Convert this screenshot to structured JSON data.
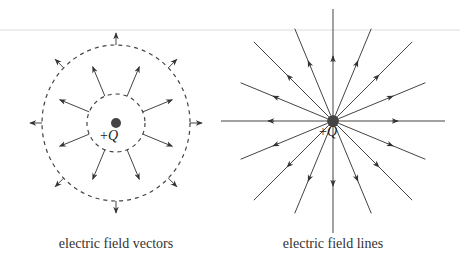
{
  "figure": {
    "left": {
      "caption": "electric field vectors",
      "charge_label_sign": "+",
      "charge_label_symbol": "Q",
      "center": [
        116,
        123
      ],
      "inner_circle_radius": 29,
      "outer_ellipse_radii": [
        74,
        78
      ],
      "inner_vector_count": 8,
      "outer_vector_count": 8
    },
    "right": {
      "caption": "electric field lines",
      "charge_label_sign": "+",
      "charge_label_symbol": "Q",
      "center": [
        333,
        121
      ],
      "line_count": 16
    },
    "colors": {
      "line": "#444444",
      "charge": "#444444",
      "rule": "#dddddd"
    }
  }
}
